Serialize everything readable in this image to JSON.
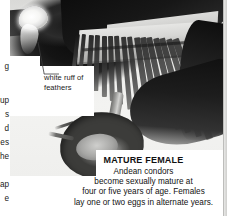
{
  "page": {
    "background_color": "#ffffff"
  },
  "photo": {
    "alt_name": "andean-condor-photo",
    "description": "Grayscale photograph of a perched Andean condor with spread wing, white neck ruff and rocky nest ledge"
  },
  "annotations": [
    {
      "id": "white-ruff",
      "label": "white ruff of\nfeathers",
      "line1": "white ruff of",
      "line2": "feathers"
    }
  ],
  "caption": {
    "title": "MATURE FEMALE",
    "line1": "Andean condors",
    "line2": "become sexually mature at",
    "line3": "four or five years of age. Females",
    "line4": "lay one or two eggs in alternate years.",
    "body": "Andean condors become sexually mature at four or five years of age. Females lay one or two eggs in alternate years."
  },
  "left_column_fragments": [
    {
      "text": "g",
      "top": 62
    },
    {
      "text": "up",
      "top": 96
    },
    {
      "text": "s",
      "top": 110
    },
    {
      "text": "d",
      "top": 124
    },
    {
      "text": "es",
      "top": 138
    },
    {
      "text": "he",
      "top": 152
    },
    {
      "text": "ap",
      "top": 180
    },
    {
      "text": "e",
      "top": 194
    }
  ],
  "colors": {
    "ink": "#111111",
    "paper": "#ffffff",
    "photo_dark": "#101010",
    "photo_mid": "#8e8e8c",
    "photo_light": "#e6e6e4",
    "gutter": "#cfcfcd"
  }
}
